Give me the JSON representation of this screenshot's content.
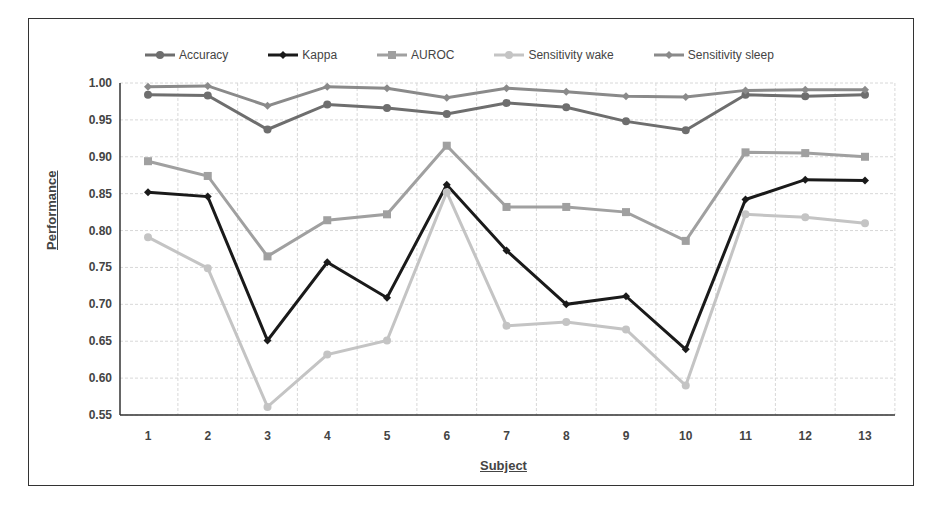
{
  "chart_data": {
    "type": "line",
    "title": "",
    "xlabel": "Subject",
    "ylabel": "Performance",
    "ylim": [
      0.55,
      1.0
    ],
    "yticks": [
      "0.55",
      "0.60",
      "0.65",
      "0.70",
      "0.75",
      "0.80",
      "0.85",
      "0.90",
      "0.95",
      "1.00"
    ],
    "categories": [
      "1",
      "2",
      "3",
      "4",
      "5",
      "6",
      "7",
      "8",
      "9",
      "10",
      "11",
      "12",
      "13"
    ],
    "grid": true,
    "legend_position": "top",
    "series": [
      {
        "name": "Accuracy",
        "color": "#6e6e6e",
        "marker": "circle",
        "values": [
          0.984,
          0.983,
          0.937,
          0.971,
          0.966,
          0.958,
          0.973,
          0.967,
          0.948,
          0.936,
          0.984,
          0.982,
          0.984
        ]
      },
      {
        "name": "Kappa",
        "color": "#1a1a1a",
        "marker": "diamond",
        "values": [
          0.852,
          0.846,
          0.651,
          0.757,
          0.709,
          0.862,
          0.773,
          0.7,
          0.711,
          0.639,
          0.842,
          0.869,
          0.868
        ]
      },
      {
        "name": "AUROC",
        "color": "#a0a0a0",
        "marker": "square",
        "values": [
          0.894,
          0.874,
          0.765,
          0.814,
          0.822,
          0.915,
          0.832,
          0.832,
          0.825,
          0.786,
          0.906,
          0.905,
          0.9
        ]
      },
      {
        "name": "Sensitivity wake",
        "color": "#c4c4c4",
        "marker": "circle",
        "values": [
          0.791,
          0.749,
          0.561,
          0.632,
          0.651,
          0.852,
          0.671,
          0.676,
          0.666,
          0.59,
          0.822,
          0.818,
          0.81
        ]
      },
      {
        "name": "Sensitivity sleep",
        "color": "#8a8a8a",
        "marker": "diamond",
        "values": [
          0.995,
          0.996,
          0.969,
          0.995,
          0.993,
          0.98,
          0.993,
          0.988,
          0.982,
          0.981,
          0.99,
          0.991,
          0.991
        ]
      }
    ]
  }
}
